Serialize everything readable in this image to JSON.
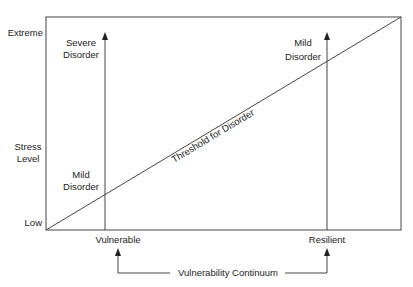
{
  "diagram": {
    "y_axis": {
      "top_label": "Extreme",
      "title_line1": "Stress",
      "title_line2": "Level",
      "bottom_label": "Low"
    },
    "x_axis": {
      "left_label": "Vulnerable",
      "right_label": "Resilient",
      "continuum_label": "Vulnerability Continuum"
    },
    "threshold_label": "Threshold for Disorder",
    "vulnerable_column": {
      "top_line1": "Severe",
      "top_line2": "Disorder",
      "bottom_line1": "Mild",
      "bottom_line2": "Disorder"
    },
    "resilient_column": {
      "top_line1": "Mild",
      "top_line2": "Disorder"
    },
    "colors": {
      "line": "#444444",
      "text": "#222222",
      "background": "#ffffff"
    }
  }
}
